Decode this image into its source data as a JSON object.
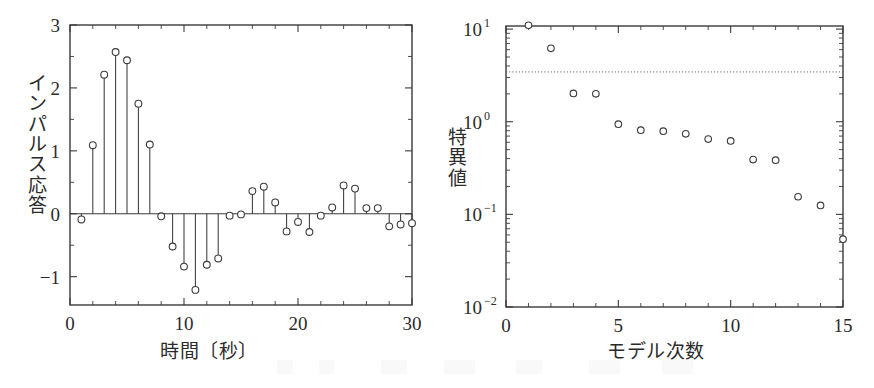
{
  "figure": {
    "panel_count": 2
  },
  "chart_data": [
    {
      "type": "stem",
      "panel": "left",
      "title": "",
      "xlabel": "時間〔秒〕",
      "ylabel": "インパルス応答",
      "xlim": [
        0,
        30
      ],
      "ylim": [
        -1.45,
        3
      ],
      "xticks": [
        0,
        10,
        20,
        30
      ],
      "xtick_labels": [
        "0",
        "10",
        "20",
        "30"
      ],
      "yticks": [
        -1,
        0,
        1,
        2,
        3
      ],
      "ytick_labels": [
        "-1",
        "0",
        "1",
        "2",
        "3"
      ],
      "ytick_shown": [
        "-1",
        "0",
        "1",
        "2",
        "3"
      ],
      "x_minor_step": 2,
      "y_minor_step": 0.5,
      "grid": false,
      "legend": null,
      "x": [
        1,
        2,
        3,
        4,
        5,
        6,
        7,
        8,
        9,
        10,
        11,
        12,
        13,
        14,
        15,
        16,
        17,
        18,
        19,
        20,
        21,
        22,
        23,
        24,
        25,
        26,
        27,
        28,
        29,
        30
      ],
      "values": [
        -0.09,
        1.09,
        2.21,
        2.57,
        2.44,
        1.75,
        1.1,
        -0.04,
        -0.52,
        -0.84,
        -1.21,
        -0.81,
        -0.71,
        -0.03,
        -0.01,
        0.36,
        0.43,
        0.18,
        -0.28,
        -0.13,
        -0.29,
        -0.03,
        0.1,
        0.45,
        0.4,
        0.09,
        0.09,
        -0.2,
        -0.17,
        -0.15
      ]
    },
    {
      "type": "scatter",
      "panel": "right",
      "title": "",
      "xlabel": "モデル次数",
      "ylabel": "特異値",
      "xlim": [
        0,
        15
      ],
      "ylim": [
        0.01,
        10.8
      ],
      "yscale": "log",
      "xticks": [
        0,
        5,
        10,
        15
      ],
      "xtick_labels": [
        "0",
        "5",
        "10",
        "15"
      ],
      "yticks": [
        0.01,
        0.1,
        1,
        10
      ],
      "ytick_labels": [
        "10",
        "10",
        "10",
        "10"
      ],
      "ytick_exponents": [
        "-2",
        "-1",
        "0",
        "1"
      ],
      "x_minor_step": 1,
      "grid": false,
      "legend": null,
      "marker": "open-circle",
      "threshold": {
        "value": 3.45,
        "style": "dotted",
        "label": ""
      },
      "x": [
        1,
        2,
        3,
        4,
        5,
        6,
        7,
        8,
        9,
        10,
        11,
        12,
        13,
        14,
        15
      ],
      "values": [
        11.0,
        6.2,
        2.02,
        2.0,
        0.94,
        0.81,
        0.79,
        0.74,
        0.65,
        0.62,
        0.39,
        0.385,
        0.155,
        0.125,
        0.054
      ]
    }
  ],
  "labels": {
    "left_y_chars": [
      "イ",
      "ン",
      "パ",
      "ル",
      "ス",
      "応",
      "答"
    ],
    "right_y_chars": [
      "特",
      "異",
      "値"
    ]
  }
}
